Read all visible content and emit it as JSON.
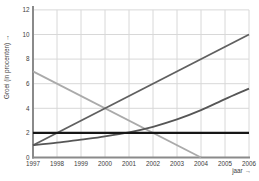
{
  "labels": {
    "arrow": "→"
  },
  "chart_data": {
    "type": "line",
    "title": "",
    "xlabel": "jaar",
    "ylabel": "Groei (in procenten)",
    "xlim": [
      1997,
      2006
    ],
    "ylim": [
      0,
      12
    ],
    "grid": true,
    "legend_position": "none",
    "x_ticks": [
      1997,
      1998,
      1999,
      2000,
      2001,
      2002,
      2003,
      2004,
      2005,
      2006
    ],
    "y_ticks": [
      0,
      2,
      4,
      6,
      8,
      10,
      12
    ],
    "axis_color": "#8a8a8a",
    "grid_color": "#d8d8d8",
    "tick_label_color": "#3d3d3d",
    "series": [
      {
        "name": "linear-decline",
        "color": "#aaaaaa",
        "x": [
          1997,
          2004
        ],
        "values": [
          7,
          0
        ]
      },
      {
        "name": "linear-growth",
        "color": "#606060",
        "x": [
          1997,
          2006
        ],
        "values": [
          1,
          10
        ]
      },
      {
        "name": "exponential-growth",
        "color": "#565656",
        "x": [
          1997,
          1998,
          1999,
          2000,
          2001,
          2002,
          2003,
          2004,
          2005,
          2006
        ],
        "values": [
          1.0,
          1.2,
          1.45,
          1.72,
          2.05,
          2.5,
          3.1,
          3.85,
          4.75,
          5.6
        ]
      },
      {
        "name": "constant-2-percent",
        "color": "#161616",
        "x": [
          1997,
          2006
        ],
        "values": [
          2,
          2
        ]
      }
    ]
  }
}
